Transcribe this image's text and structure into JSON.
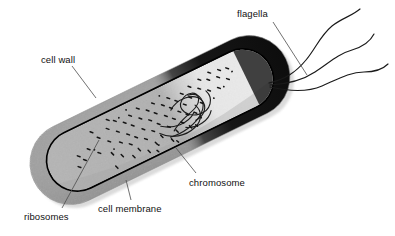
{
  "figure": {
    "background_color": "#ffffff",
    "ink_color": "#111111"
  },
  "labels": [
    {
      "id": "flagella",
      "text": "flagella",
      "name": "label-flagella"
    },
    {
      "id": "cell_wall",
      "text": "cell wall",
      "name": "label-cell-wall"
    },
    {
      "id": "chromosome",
      "text": "chromosome",
      "name": "label-chromosome"
    },
    {
      "id": "cell_membrane",
      "text": "cell membrane",
      "name": "label-cell-membrane"
    },
    {
      "id": "ribosomes",
      "text": "ribosomes",
      "name": "label-ribosomes"
    }
  ],
  "colors": {
    "cell_wall_gray": "#9a9a9a",
    "cytoplasm_gray": "#b2b2b2",
    "cytoplasm_light": "#e6e6e6",
    "dark_end": "#1a1a1a",
    "membrane_line": "#000000",
    "leader_line": "#555555",
    "background": "#ffffff"
  },
  "structures": [
    {
      "name": "cell-wall-layer",
      "description": "outer gray capsule layer"
    },
    {
      "name": "cell-membrane-line",
      "description": "thick black boundary inside the wall"
    },
    {
      "name": "cytoplasm",
      "description": "light gray interior region"
    },
    {
      "name": "dark-pole",
      "description": "solid black right-hand pole of the cell"
    },
    {
      "name": "ribosome-speckles",
      "description": "dense cluster of small dark dashes"
    },
    {
      "name": "chromosome-loops",
      "description": "tangled looped thread in the cytoplasm"
    },
    {
      "name": "flagella-strands",
      "description": "three long wavy filaments from the right pole"
    }
  ]
}
